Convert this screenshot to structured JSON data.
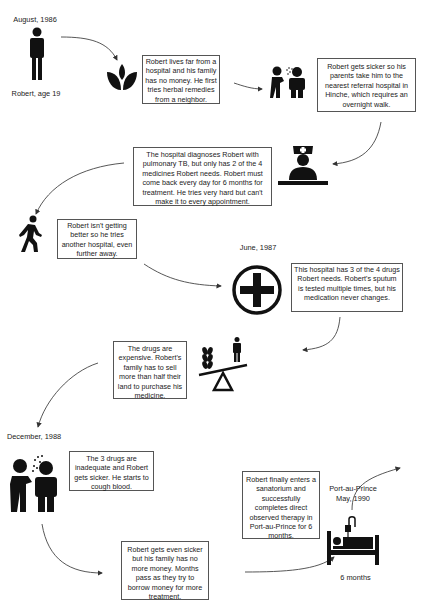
{
  "timeline": {
    "start": {
      "date": "August, 1986",
      "person_label": "Robert, age 19"
    },
    "events": [
      {
        "id": "herbal",
        "text": "Robert lives far from a hospital and his family has no money. He first tries herbal remedies from a neighbor.",
        "icon": "herbal-leaf-icon"
      },
      {
        "id": "sicker",
        "text": "Robert gets sicker so his parents take him to the nearest referral hospital in Hinche, which requires an overnight walk.",
        "icon": "coughing-people-icon"
      },
      {
        "id": "diagnosis",
        "text": "The hospital diagnoses Robert with pulmonary TB, but only has 2 of the 4 medicines Robert needs. Robert must come back every day for 6 months for treatment. He tries very hard but can't make it to every appointment.",
        "icon": "nurse-icon"
      },
      {
        "id": "another-hospital",
        "text": "Robert isn't getting better so he tries another hospital, even further away.",
        "icon": "walking-person-icon"
      },
      {
        "id": "three-drugs",
        "date": "June, 1987",
        "text": "This hospital has 3 of the 4 drugs Robert needs. Robert's sputum is tested multiple times, but his medication never changes.",
        "icon": "medical-cross-icon"
      },
      {
        "id": "expensive",
        "text": "The drugs are expensive. Robert's family has to sell more than half their land to purchase his medicine.",
        "icon": "seesaw-land-person-icon"
      },
      {
        "id": "cough-blood",
        "date": "December, 1988",
        "text": "The 3 drugs are inadequate and Robert gets sicker. He starts to cough blood.",
        "icon": "coughing-people-icon"
      },
      {
        "id": "no-money",
        "text": "Robert gets even sicker but his family has no more money. Months pass as they try to borrow money for more treatment."
      },
      {
        "id": "sanatorium",
        "text": "Robert finally enters a sanatorium and successfully completes direct observed therapy in Port-au-Prince for 6 months."
      },
      {
        "id": "end",
        "date": "Port-au-Prince\nMay, 1990",
        "duration": "6 months",
        "icon": "hospital-bed-icon"
      }
    ]
  }
}
